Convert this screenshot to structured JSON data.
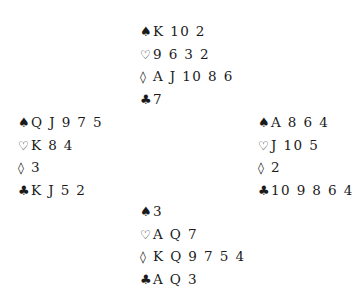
{
  "suits": {
    "spades": "♠",
    "hearts": "♡",
    "diamonds": "◊",
    "clubs": "♣"
  },
  "hands": {
    "north": {
      "spades": "K 10 2",
      "hearts": "9 6 3 2",
      "diamonds": "A J 10 8 6",
      "clubs": "7"
    },
    "west": {
      "spades": "Q J 9 7 5",
      "hearts": "K 8 4",
      "diamonds": "3",
      "clubs": "K J 5 2"
    },
    "east": {
      "spades": "A 8 6 4",
      "hearts": "J 10 5",
      "diamonds": "2",
      "clubs": "10 9 8 6 4"
    },
    "south": {
      "spades": "3",
      "hearts": "A Q 7",
      "diamonds": "K Q 9 7 5 4",
      "clubs": "A Q 3"
    }
  }
}
